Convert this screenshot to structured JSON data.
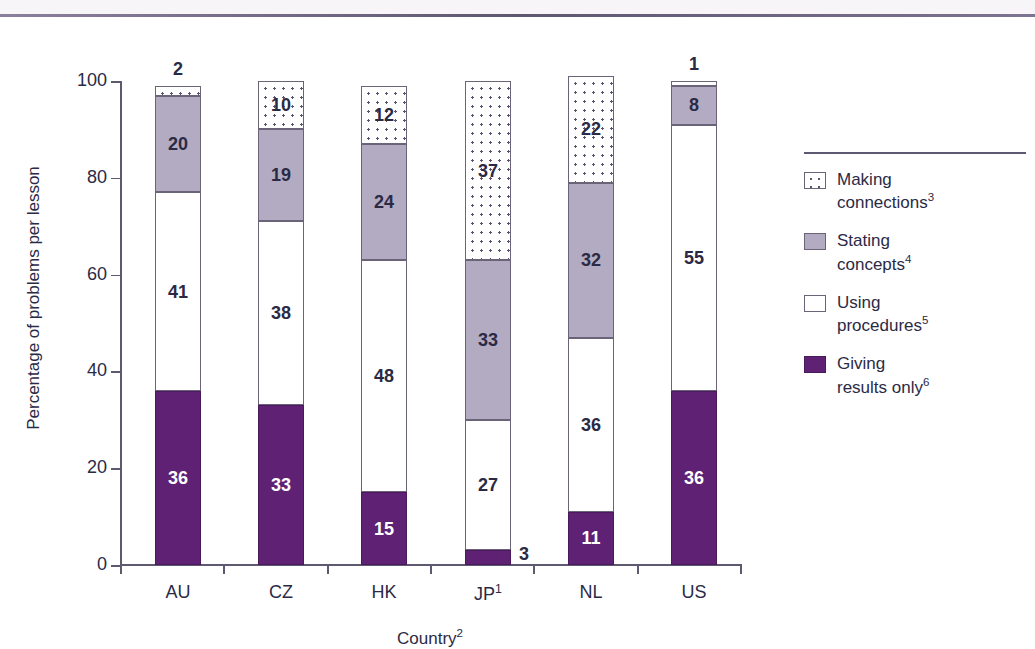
{
  "chart_data": {
    "type": "bar",
    "subtype": "stacked-bar-100",
    "title": "",
    "xlabel": "Country",
    "xlabel_sup": "2",
    "ylabel": "Percentage of problems per lesson",
    "ylim": [
      0,
      100
    ],
    "yticks": [
      0,
      20,
      40,
      60,
      80,
      100
    ],
    "grid": false,
    "legend_position": "right",
    "categories": [
      "AU",
      "CZ",
      "HK",
      "JP",
      "NL",
      "US"
    ],
    "category_sups": [
      "",
      "",
      "",
      "1",
      "",
      ""
    ],
    "series": [
      {
        "name": "Giving results only",
        "sup": "6",
        "color": "#5e2174",
        "fill": "solid-dark-purple",
        "values": [
          36,
          33,
          15,
          3,
          11,
          36
        ]
      },
      {
        "name": "Using procedures",
        "sup": "5",
        "color": "#ffffff",
        "fill": "white",
        "values": [
          41,
          38,
          48,
          27,
          36,
          55
        ]
      },
      {
        "name": "Stating concepts",
        "sup": "4",
        "color": "#b3abc1",
        "fill": "solid-mauve",
        "values": [
          20,
          19,
          24,
          33,
          32,
          8
        ]
      },
      {
        "name": "Making connections",
        "sup": "3",
        "color": "#ffffff",
        "fill": "dotted",
        "values": [
          2,
          10,
          12,
          37,
          22,
          1
        ]
      }
    ],
    "external_labels": [
      {
        "category": "AU",
        "series": "Making connections",
        "value": 2,
        "placement": "above"
      },
      {
        "category": "JP",
        "series": "Giving results only",
        "value": 3,
        "placement": "right"
      },
      {
        "category": "US",
        "series": "Making connections",
        "value": 1,
        "placement": "above"
      }
    ]
  },
  "legend": {
    "items": [
      {
        "label_line1": "Making",
        "label_line2": "connections",
        "sup": "3",
        "swatch": "making"
      },
      {
        "label_line1": "Stating",
        "label_line2": "concepts",
        "sup": "4",
        "swatch": "stating"
      },
      {
        "label_line1": "Using",
        "label_line2": "procedures",
        "sup": "5",
        "swatch": "using"
      },
      {
        "label_line1": "Giving",
        "label_line2": "results only",
        "sup": "6",
        "swatch": "giving"
      }
    ]
  },
  "axis": {
    "y_title": "Percentage of problems per lesson",
    "x_title": "Country",
    "x_title_sup": "2",
    "y_tick_labels": [
      "100",
      "80",
      "60",
      "40",
      "20",
      "0"
    ],
    "x_tick_labels": [
      "AU",
      "CZ",
      "HK",
      "JP",
      "NL",
      "US"
    ],
    "x_tick_sups": [
      "",
      "",
      "",
      "1",
      "",
      ""
    ]
  },
  "colors": {
    "giving_results_only": "#5e2174",
    "stating_concepts": "#b3abc1",
    "using_procedures": "#ffffff",
    "making_connections": "#ffffff",
    "axis": "#5e5870",
    "text": "#2b2a45",
    "top_rule": "#6f6685"
  }
}
